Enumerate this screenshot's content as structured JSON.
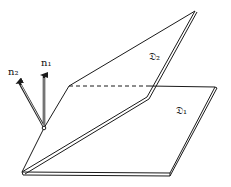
{
  "diagram": {
    "labels": {
      "plane1": "𝔇₁",
      "plane2": "𝔇₂",
      "normal1": "n₁",
      "normal2": "n₂"
    },
    "colors": {
      "stroke": "#1a1a1a",
      "background": "#ffffff"
    }
  }
}
